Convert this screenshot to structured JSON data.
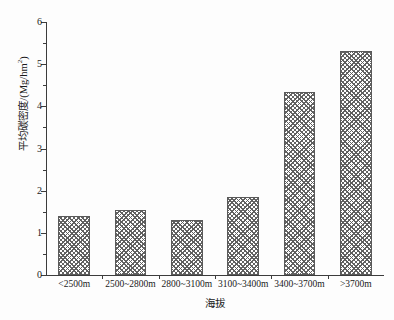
{
  "chart_data": {
    "type": "bar",
    "title": "",
    "xlabel": "海拔",
    "ylabel": "平均碳密度/(Mg/hm²)",
    "ylabel_main": "平均碳密度/(Mg/hm",
    "ylabel_sup": "2",
    "ylabel_tail": ")",
    "categories": [
      "<2500m",
      "2500~2800m",
      "2800~3100m",
      "3100~3400m",
      "3400~3700m",
      ">3700m"
    ],
    "values": [
      1.39,
      1.54,
      1.3,
      1.86,
      4.33,
      5.32
    ],
    "ylim": [
      0,
      6
    ],
    "ytick_labels": [
      "0",
      "1",
      "2",
      "3",
      "4",
      "5",
      "6"
    ],
    "ytick_values": [
      0,
      1,
      2,
      3,
      4,
      5,
      6
    ],
    "yminor_values": [
      0.5,
      1.5,
      2.5,
      3.5,
      4.5,
      5.5
    ],
    "grid": false,
    "legend": null,
    "bar_fill": "crosshatch-gray",
    "bar_edge_color": "#5a5a5a",
    "axis_color": "#3c3c3c",
    "background_color": "#ffffff"
  }
}
